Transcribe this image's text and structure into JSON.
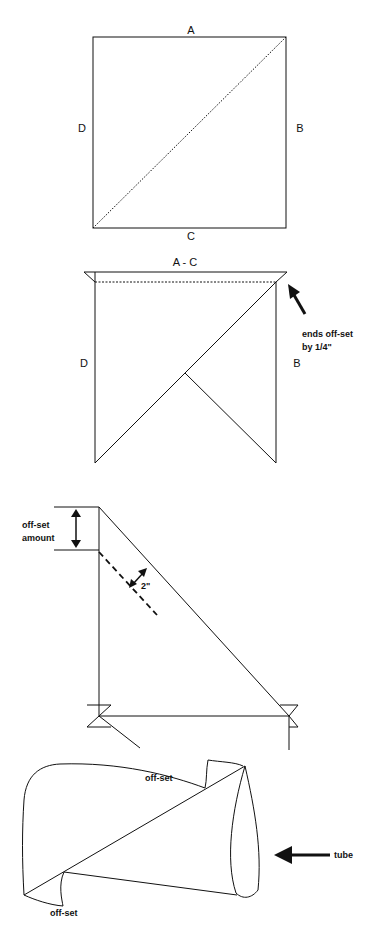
{
  "figure1": {
    "labels": {
      "top": "A",
      "right": "B",
      "bottom": "C",
      "left": "D"
    }
  },
  "figure2": {
    "labels": {
      "top": "A - C",
      "left": "D",
      "right": "B"
    },
    "annotation_line1": "ends off-set",
    "annotation_line2": "by 1/4\""
  },
  "figure3": {
    "offset_line1": "off-set",
    "offset_line2": "amount",
    "distance": "2\""
  },
  "figure4": {
    "offset_top": "off-set",
    "offset_bottom": "off-set",
    "tube_label": "tube"
  },
  "colors": {
    "stroke": "#111111",
    "background": "#ffffff"
  }
}
